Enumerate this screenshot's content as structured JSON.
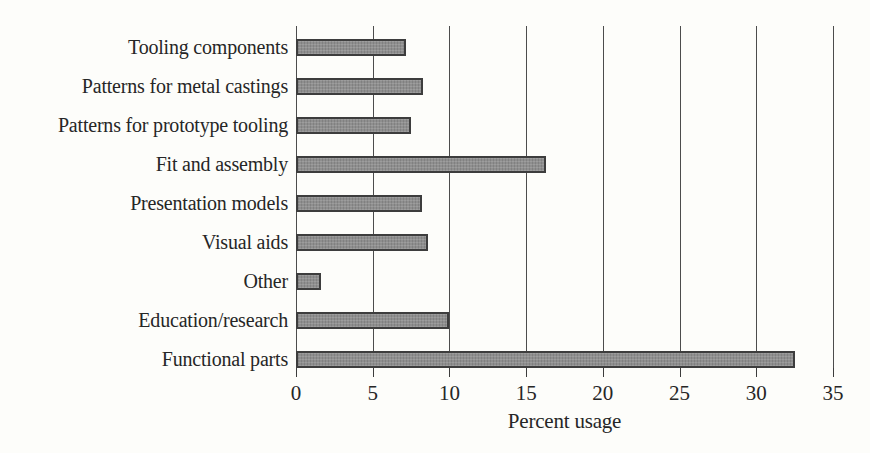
{
  "chart_data": {
    "type": "bar",
    "orientation": "horizontal",
    "title": "",
    "xlabel": "Percent usage",
    "ylabel": "",
    "categories": [
      "Tooling components",
      "Patterns for metal castings",
      "Patterns for prototype tooling",
      "Fit and assembly",
      "Presentation models",
      "Visual aids",
      "Other",
      "Education/research",
      "Functional parts"
    ],
    "values": [
      7.2,
      8.3,
      7.5,
      16.3,
      8.2,
      8.6,
      1.6,
      10,
      32.5
    ],
    "xlim": [
      0,
      35
    ],
    "xticks": [
      0,
      5,
      10,
      15,
      20,
      25,
      30,
      35
    ],
    "grid": "vertical gridlines at every x tick, full plot height",
    "legend": "none",
    "colors": {
      "bar_fill": "#8f8f8f",
      "bar_border": "#3d3d3d",
      "gridline": "#4c4c4c",
      "text": "#262626",
      "background": "#fdfdfa"
    }
  }
}
